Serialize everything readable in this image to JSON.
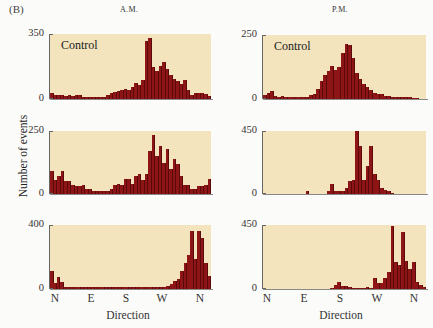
{
  "figure": {
    "panel_label": "(B)",
    "columns": [
      "A.M.",
      "P.M."
    ],
    "ylabel": "Number of events",
    "xlabel": "Direction",
    "xticks": [
      "N",
      "E",
      "S",
      "W",
      "N"
    ],
    "control_label": "Control",
    "colors": {
      "bar": "#8e1515",
      "plot_bg": "#f3e4bd"
    }
  },
  "chart_data": [
    {
      "type": "bar",
      "id": "am_control",
      "column": "A.M.",
      "annotation": "Control",
      "xlabel": "Direction",
      "ylabel": "Number of events",
      "ylim": [
        0,
        350
      ],
      "yticks": [
        "0",
        "350"
      ],
      "xticks": [
        "N",
        "E",
        "S",
        "W",
        "N"
      ],
      "values": [
        30,
        22,
        20,
        22,
        18,
        20,
        15,
        22,
        20,
        10,
        10,
        10,
        10,
        10,
        10,
        12,
        20,
        30,
        40,
        45,
        50,
        55,
        50,
        65,
        85,
        75,
        100,
        310,
        330,
        170,
        150,
        180,
        200,
        160,
        130,
        110,
        95,
        80,
        100,
        50,
        20,
        30,
        35,
        30,
        25,
        15
      ]
    },
    {
      "type": "bar",
      "id": "pm_control",
      "column": "P.M.",
      "annotation": "Control",
      "xlabel": "Direction",
      "ylabel": "Number of events",
      "ylim": [
        0,
        250
      ],
      "yticks": [
        "0",
        "250"
      ],
      "xticks": [
        "N",
        "E",
        "S",
        "W",
        "N"
      ],
      "values": [
        15,
        25,
        30,
        10,
        8,
        10,
        8,
        8,
        8,
        8,
        8,
        8,
        8,
        15,
        18,
        40,
        70,
        95,
        110,
        130,
        115,
        125,
        180,
        215,
        210,
        160,
        100,
        80,
        60,
        45,
        35,
        25,
        20,
        18,
        12,
        10,
        8,
        8,
        6,
        6,
        8,
        6,
        5,
        4,
        0,
        0
      ]
    },
    {
      "type": "bar",
      "id": "am_middle",
      "column": "A.M.",
      "xlabel": "Direction",
      "ylabel": "Number of events",
      "ylim": [
        0,
        250
      ],
      "yticks": [
        "0",
        "250"
      ],
      "xticks": [
        "N",
        "E",
        "S",
        "W",
        "N"
      ],
      "values": [
        90,
        55,
        70,
        90,
        50,
        50,
        35,
        30,
        30,
        35,
        20,
        20,
        12,
        12,
        12,
        12,
        12,
        20,
        35,
        40,
        35,
        60,
        60,
        40,
        70,
        80,
        55,
        80,
        170,
        235,
        150,
        190,
        125,
        180,
        100,
        140,
        120,
        70,
        35,
        35,
        20,
        20,
        30,
        30,
        35,
        60
      ]
    },
    {
      "type": "bar",
      "id": "pm_middle",
      "column": "P.M.",
      "xlabel": "Direction",
      "ylabel": "Number of events",
      "ylim": [
        0,
        450
      ],
      "yticks": [
        "0",
        "450"
      ],
      "xticks": [
        "N",
        "E",
        "S",
        "W",
        "N"
      ],
      "values": [
        0,
        0,
        0,
        0,
        0,
        0,
        0,
        0,
        0,
        0,
        0,
        0,
        25,
        0,
        0,
        0,
        0,
        0,
        20,
        70,
        20,
        20,
        20,
        40,
        90,
        100,
        450,
        340,
        100,
        200,
        340,
        140,
        100,
        40,
        30,
        20,
        10,
        0,
        0,
        0,
        0,
        0,
        0,
        0,
        0,
        0
      ]
    },
    {
      "type": "bar",
      "id": "am_bottom",
      "column": "A.M.",
      "xlabel": "Direction",
      "ylabel": "Number of events",
      "ylim": [
        0,
        400
      ],
      "yticks": [
        "0",
        "400"
      ],
      "xticks": [
        "N",
        "E",
        "S",
        "W",
        "N"
      ],
      "values": [
        110,
        35,
        75,
        45,
        15,
        15,
        15,
        15,
        15,
        15,
        15,
        15,
        15,
        15,
        15,
        15,
        15,
        15,
        15,
        15,
        15,
        15,
        15,
        15,
        15,
        15,
        15,
        15,
        15,
        15,
        15,
        15,
        15,
        15,
        20,
        30,
        50,
        65,
        110,
        160,
        210,
        360,
        185,
        360,
        320,
        160,
        80
      ]
    },
    {
      "type": "bar",
      "id": "pm_bottom",
      "column": "P.M.",
      "xlabel": "Direction",
      "ylabel": "Number of events",
      "ylim": [
        0,
        450
      ],
      "yticks": [
        "0",
        "450"
      ],
      "xticks": [
        "N",
        "E",
        "S",
        "W",
        "N"
      ],
      "values": [
        0,
        0,
        0,
        0,
        0,
        0,
        0,
        0,
        0,
        0,
        0,
        0,
        0,
        0,
        0,
        0,
        0,
        0,
        0,
        10,
        25,
        50,
        20,
        20,
        15,
        10,
        10,
        10,
        10,
        15,
        10,
        80,
        40,
        40,
        80,
        120,
        440,
        190,
        170,
        400,
        200,
        140,
        190,
        50,
        30,
        15
      ]
    }
  ]
}
